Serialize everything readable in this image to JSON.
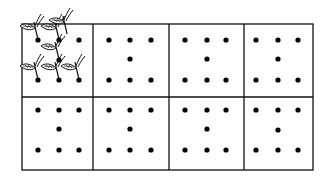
{
  "diagram": {
    "rows": 2,
    "columns": 4,
    "points_per_plot": 7,
    "planted_plot_index": 0,
    "colors": {
      "line": "#111111",
      "dot": "#000000",
      "background": "#ffffff"
    }
  }
}
